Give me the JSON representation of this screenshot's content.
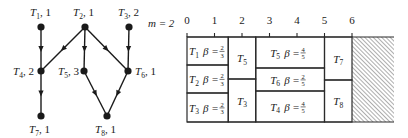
{
  "graph": {
    "nodes": [
      {
        "id": "T1",
        "sub": "1",
        "weight": "1",
        "x": 41,
        "y": 27,
        "lx": 30,
        "ly": 16,
        "anchor": "start"
      },
      {
        "id": "T2",
        "sub": "2",
        "weight": "1",
        "x": 85,
        "y": 27,
        "lx": 73,
        "ly": 16,
        "anchor": "start"
      },
      {
        "id": "T3",
        "sub": "3",
        "weight": "2",
        "x": 129,
        "y": 27,
        "lx": 118,
        "ly": 16,
        "anchor": "start"
      },
      {
        "id": "T4",
        "sub": "4",
        "weight": "2",
        "x": 41,
        "y": 71,
        "lx": 13,
        "ly": 75,
        "anchor": "start"
      },
      {
        "id": "T5",
        "sub": "5",
        "weight": "3",
        "x": 84,
        "y": 71,
        "lx": 58,
        "ly": 75,
        "anchor": "start"
      },
      {
        "id": "T6",
        "sub": "6",
        "weight": "1",
        "x": 128,
        "y": 71,
        "lx": 135,
        "ly": 75,
        "anchor": "start"
      },
      {
        "id": "T7",
        "sub": "7",
        "weight": "1",
        "x": 41,
        "y": 116,
        "lx": 29,
        "ly": 133,
        "anchor": "start"
      },
      {
        "id": "T8",
        "sub": "8",
        "weight": "1",
        "x": 107,
        "y": 116,
        "lx": 95,
        "ly": 133,
        "anchor": "start"
      }
    ],
    "edges": [
      [
        "T1",
        "T4"
      ],
      [
        "T2",
        "T4"
      ],
      [
        "T2",
        "T5"
      ],
      [
        "T2",
        "T6"
      ],
      [
        "T3",
        "T6"
      ],
      [
        "T4",
        "T7"
      ],
      [
        "T5",
        "T8"
      ],
      [
        "T6",
        "T8"
      ]
    ]
  },
  "schedule": {
    "m_label": "m = 2",
    "axis_ticks": [
      "0",
      "1",
      "2",
      "3",
      "4",
      "5",
      "6"
    ],
    "origin_x": 187,
    "unit_px": 27.5,
    "top_y": 37,
    "bottom_y": 122,
    "hatch_end_x": 394,
    "blocks": [
      {
        "task": "T",
        "sub": "1",
        "beta": "β =",
        "num": "2",
        "den": "3",
        "x0": 0,
        "x1": 1.5,
        "y0": 37,
        "y1": 65
      },
      {
        "task": "T",
        "sub": "2",
        "beta": "β =",
        "num": "2",
        "den": "3",
        "x0": 0,
        "x1": 1.5,
        "y0": 65,
        "y1": 93
      },
      {
        "task": "T",
        "sub": "3",
        "beta": "β =",
        "num": "2",
        "den": "3",
        "x0": 0,
        "x1": 1.5,
        "y0": 93,
        "y1": 122
      },
      {
        "task": "T",
        "sub": "5",
        "beta": "",
        "num": "",
        "den": "",
        "x0": 1.5,
        "x1": 2.5,
        "y0": 37,
        "y1": 79
      },
      {
        "task": "T",
        "sub": "3",
        "beta": "",
        "num": "",
        "den": "",
        "x0": 1.5,
        "x1": 2.5,
        "y0": 79,
        "y1": 122
      },
      {
        "task": "T",
        "sub": "5",
        "beta": "β =",
        "num": "4",
        "den": "5",
        "x0": 2.5,
        "x1": 5,
        "y0": 37,
        "y1": 68
      },
      {
        "task": "T",
        "sub": "6",
        "beta": "β =",
        "num": "2",
        "den": "5",
        "x0": 2.5,
        "x1": 5,
        "y0": 68,
        "y1": 91
      },
      {
        "task": "T",
        "sub": "4",
        "beta": "β =",
        "num": "4",
        "den": "5",
        "x0": 2.5,
        "x1": 5,
        "y0": 91,
        "y1": 122
      },
      {
        "task": "T",
        "sub": "7",
        "beta": "",
        "num": "",
        "den": "",
        "x0": 5,
        "x1": 6,
        "y0": 37,
        "y1": 80
      },
      {
        "task": "T",
        "sub": "8",
        "beta": "",
        "num": "",
        "den": "",
        "x0": 5,
        "x1": 6,
        "y0": 80,
        "y1": 122
      }
    ],
    "idle_region": {
      "from": 6,
      "pattern": "diagonal-hatch"
    }
  }
}
